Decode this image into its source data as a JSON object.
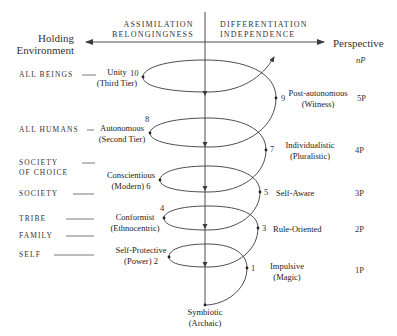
{
  "header": {
    "left_axis": [
      "ASSIMILATION",
      "BELONGINGNESS"
    ],
    "right_axis": [
      "DIFFERENTIATION",
      "INDEPENDENCE"
    ],
    "left_title": [
      "Holding",
      "Environment"
    ],
    "right_title": "Perspective"
  },
  "holding_environments": [
    {
      "label": "ALL BEINGS"
    },
    {
      "label": "ALL HUMANS"
    },
    {
      "label": [
        "SOCIETY",
        "OF CHOICE"
      ]
    },
    {
      "label": "SOCIETY"
    },
    {
      "label": "TRIBE"
    },
    {
      "label": "FAMILY"
    },
    {
      "label": "SELF"
    }
  ],
  "stages": [
    {
      "num": "1",
      "name": "Impulsive",
      "sub": "(Magic)",
      "side": "right",
      "perspective": "1P"
    },
    {
      "num": "2",
      "name": "Self-Protective",
      "sub": "(Power)",
      "side": "left"
    },
    {
      "num": "3",
      "name": "Rule-Oriented",
      "sub": "",
      "side": "right",
      "perspective": "2P"
    },
    {
      "num": "4",
      "name": "Conformist",
      "sub": "(Ethnocentric)",
      "side": "left"
    },
    {
      "num": "5",
      "name": "Self-Aware",
      "sub": "",
      "side": "right",
      "perspective": "3P"
    },
    {
      "num": "6",
      "name": "Conscientious",
      "sub": "(Modern)",
      "side": "left"
    },
    {
      "num": "7",
      "name": "Individualistic",
      "sub": "(Pluralistic)",
      "side": "right",
      "perspective": "4P"
    },
    {
      "num": "8",
      "name": "Autonomous",
      "sub": "(Second Tier)",
      "side": "left"
    },
    {
      "num": "9",
      "name": "Post-autonomous",
      "sub": "(Witness)",
      "side": "right",
      "perspective": "5P"
    },
    {
      "num": "10",
      "name": "Unity",
      "sub": "(Third Tier)",
      "side": "left"
    }
  ],
  "origin": {
    "name": "Symbiotic",
    "sub": "(Archaic)"
  },
  "top_perspective": "nP",
  "colors": {
    "line": "#3a3a3a",
    "text": "#333333",
    "background": "#ffffff"
  }
}
